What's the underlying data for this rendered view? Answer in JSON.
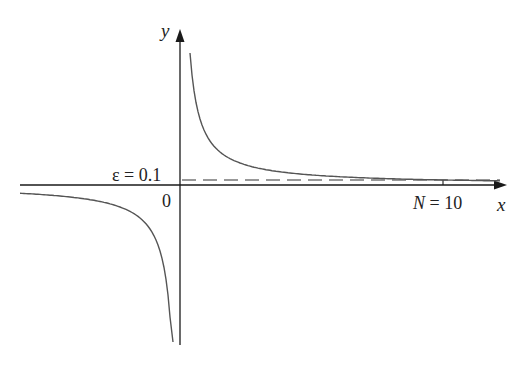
{
  "figure": {
    "axes": {
      "x_label": "x",
      "y_label": "y",
      "origin_label": "0"
    },
    "annotations": {
      "epsilon_label": "ε = 0.1",
      "n_label": "N = 10"
    },
    "colors": {
      "axis": "#1a1a1a",
      "curve": "#555555",
      "dashed": "#333333",
      "text": "#222222"
    }
  },
  "chart_data": {
    "type": "line",
    "title": "",
    "function": "y = 1/x",
    "xlabel": "x",
    "ylabel": "y",
    "series": [
      {
        "name": "y=1/x (x>0)",
        "x": [
          0.4,
          0.6,
          1,
          2,
          4,
          6,
          8,
          10,
          12
        ],
        "y": [
          2.5,
          1.667,
          1.0,
          0.5,
          0.25,
          0.167,
          0.125,
          0.1,
          0.083
        ]
      },
      {
        "name": "y=1/x (x<0)",
        "x": [
          -7,
          -4,
          -2,
          -1,
          -0.6,
          -0.4
        ],
        "y": [
          -0.143,
          -0.25,
          -0.5,
          -1.0,
          -1.667,
          -2.5
        ]
      }
    ],
    "reference_lines": [
      {
        "type": "horizontal",
        "y": 0.1,
        "style": "dashed",
        "label": "ε = 0.1"
      },
      {
        "type": "vertical_tick",
        "x": 10,
        "label": "N = 10"
      }
    ],
    "grid": false,
    "legend": null
  }
}
